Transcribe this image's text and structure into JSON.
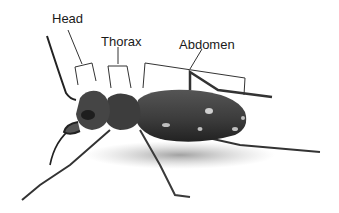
{
  "diagram": {
    "labels": [
      {
        "id": "head",
        "text": "Head"
      },
      {
        "id": "thorax",
        "text": "Thorax"
      },
      {
        "id": "abdomen",
        "text": "Abdomen"
      }
    ],
    "colors": {
      "background": "#ffffff",
      "body": "#3a3a3a",
      "body_dark": "#222222",
      "spots": "#cfcfcf",
      "lines": "#333333",
      "shadow": "#9a9a9a"
    }
  }
}
